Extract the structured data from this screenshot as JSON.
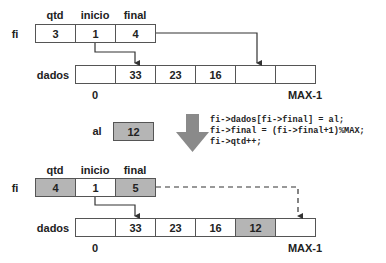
{
  "before": {
    "struct_label": "fi",
    "fields": [
      {
        "name": "qtd",
        "value": "3",
        "highlight": false
      },
      {
        "name": "inicio",
        "value": "1",
        "highlight": false
      },
      {
        "name": "final",
        "value": "4",
        "highlight": false
      }
    ],
    "array_label": "dados",
    "array_cells": [
      "",
      "33",
      "23",
      "16",
      "",
      ""
    ],
    "array_highlight": [
      false,
      false,
      false,
      false,
      false,
      false
    ],
    "index_start": "0",
    "index_end": "MAX-1"
  },
  "operation": {
    "input_label": "al",
    "input_value": "12",
    "arrow": "down-arrow",
    "code_lines": [
      "fi->dados[fi->final] = al;",
      "fi->final = (fi->final+1)%MAX;",
      "fi->qtd++;"
    ]
  },
  "after": {
    "struct_label": "fi",
    "fields": [
      {
        "name": "qtd",
        "value": "4",
        "highlight": true
      },
      {
        "name": "inicio",
        "value": "1",
        "highlight": false
      },
      {
        "name": "final",
        "value": "5",
        "highlight": true
      }
    ],
    "array_label": "dados",
    "array_cells": [
      "",
      "33",
      "23",
      "16",
      "12",
      ""
    ],
    "array_highlight": [
      false,
      false,
      false,
      false,
      true,
      false
    ],
    "index_start": "0",
    "index_end": "MAX-1"
  },
  "colors": {
    "highlight": "#b5b5b5",
    "border": "#555555",
    "arrow": "#8a8a8a",
    "line": "#333333"
  }
}
